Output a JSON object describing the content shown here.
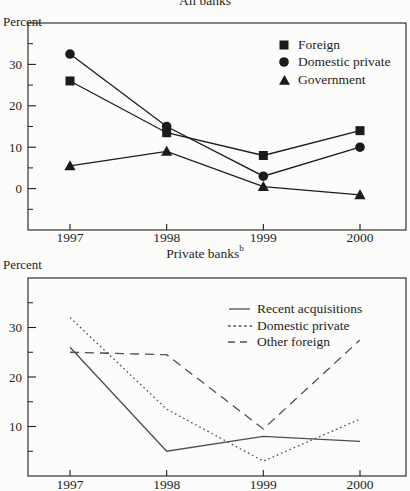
{
  "page": {
    "background": "#fcfcfb",
    "ink_color": "#1e1e1e",
    "top_series_color": "#1b1b1b",
    "bottom_series_color": "#4e4e4e"
  },
  "chart_data": [
    {
      "type": "line",
      "title": "All banks",
      "ylabel": "Percent",
      "categories": [
        "1997",
        "1998",
        "1999",
        "2000"
      ],
      "series": [
        {
          "name": "Foreign",
          "marker": "square",
          "line": "solid",
          "values": [
            26,
            13.5,
            8,
            14
          ]
        },
        {
          "name": "Domestic private",
          "marker": "circle",
          "line": "solid",
          "values": [
            32.5,
            15,
            3,
            10
          ]
        },
        {
          "name": "Government",
          "marker": "triangle",
          "line": "solid",
          "values": [
            5.5,
            9,
            0.5,
            -1.5
          ]
        }
      ],
      "ylim": [
        -10,
        40
      ],
      "yticks": [
        0,
        10,
        20,
        30
      ],
      "minor_tick_step": 5,
      "grid": false,
      "legend_position": "top-right-inside"
    },
    {
      "type": "line",
      "title": "Private banks",
      "title_superscript": "b",
      "ylabel": "Percent",
      "categories": [
        "1997",
        "1998",
        "1999",
        "2000"
      ],
      "series": [
        {
          "name": "Recent acquisitions",
          "line": "solid",
          "values": [
            26,
            5,
            8,
            7
          ]
        },
        {
          "name": "Domestic private",
          "line": "dotted",
          "values": [
            32,
            13.5,
            3,
            11.5
          ]
        },
        {
          "name": "Other foreign",
          "line": "dashed",
          "values": [
            25,
            24.5,
            9.5,
            27.5
          ]
        }
      ],
      "ylim": [
        0,
        40
      ],
      "yticks": [
        10,
        20,
        30
      ],
      "minor_tick_step": 5,
      "grid": false,
      "legend_position": "top-right-inside"
    }
  ]
}
